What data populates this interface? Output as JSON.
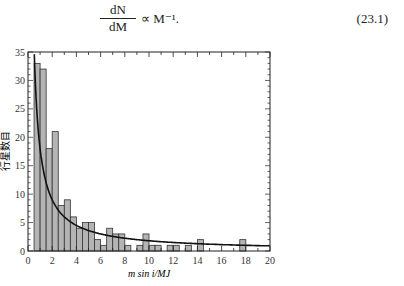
{
  "equation": {
    "numerator": "dN",
    "denominator": "dM",
    "rhs": "∝ M⁻¹.",
    "number": "(23.1)"
  },
  "chart_data": {
    "type": "bar",
    "title": "",
    "xlabel": "m sin i/MJ",
    "ylabel": "行星数目",
    "xlim": [
      0,
      20
    ],
    "ylim": [
      0,
      35
    ],
    "grid": false,
    "legend": null,
    "x_ticks": [
      "0",
      "2",
      "4",
      "6",
      "8",
      "10",
      "12",
      "14",
      "16",
      "18",
      "20"
    ],
    "y_ticks": [
      "0",
      "5",
      "10",
      "15",
      "20",
      "25",
      "30",
      "35"
    ],
    "bin_width": 0.5,
    "bin_starts": [
      0.5,
      1.0,
      1.5,
      2.0,
      2.5,
      3.0,
      3.5,
      4.0,
      4.5,
      5.0,
      5.5,
      6.0,
      6.5,
      7.0,
      7.5,
      8.0,
      8.5,
      9.0,
      9.5,
      10.0,
      10.5,
      11.0,
      11.5,
      12.0,
      12.5,
      13.0,
      13.5,
      14.0,
      14.5,
      15.0,
      15.5,
      16.0,
      16.5,
      17.0,
      17.5
    ],
    "values": [
      33,
      32,
      18,
      21,
      8,
      9,
      6,
      4,
      5,
      5,
      2,
      1,
      4,
      3,
      3,
      1,
      0,
      1,
      3,
      1,
      1,
      0,
      1,
      1,
      0,
      1,
      0,
      2,
      0,
      0,
      0,
      0,
      0,
      0,
      2
    ],
    "fit_curve": {
      "description": "dN/dM ∝ M^-1 fit",
      "formula": "k / x",
      "k": 18,
      "x_start": 0.52
    },
    "bar_color": "#b4b4b4",
    "bar_edge": "#333333",
    "curve_color": "#111111"
  }
}
